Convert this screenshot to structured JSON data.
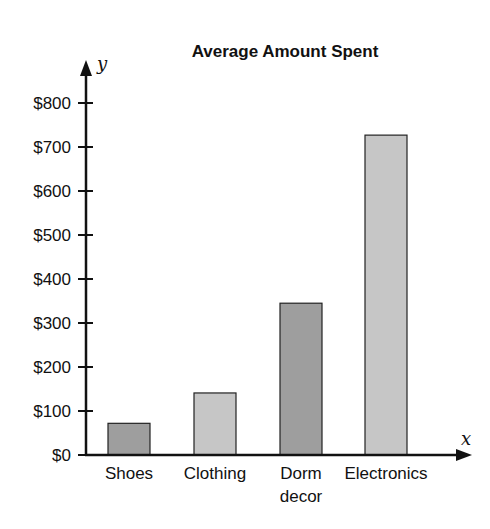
{
  "chart_data": {
    "type": "bar",
    "title": "Average Amount Spent",
    "xlabel": "x",
    "ylabel": "y",
    "categories": [
      "Shoes",
      "Clothing",
      "Dorm decor",
      "Electronics"
    ],
    "category_lines": [
      [
        "Shoes"
      ],
      [
        "Clothing"
      ],
      [
        "Dorm",
        "decor"
      ],
      [
        "Electronics"
      ]
    ],
    "values": [
      72,
      141,
      345,
      727
    ],
    "bar_colors": [
      "#9e9e9e",
      "#c6c6c6",
      "#9e9e9e",
      "#c6c6c6"
    ],
    "ylim": [
      0,
      800
    ],
    "yticks": [
      0,
      100,
      200,
      300,
      400,
      500,
      600,
      700,
      800
    ],
    "ytick_labels": [
      "$0",
      "$100",
      "$200",
      "$300",
      "$400",
      "$500",
      "$600",
      "$700",
      "$800"
    ],
    "grid": false,
    "legend": null
  }
}
